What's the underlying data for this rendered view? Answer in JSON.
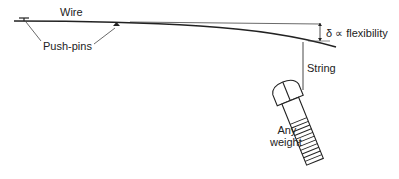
{
  "diagram": {
    "labels": {
      "wire": "Wire",
      "push_pins": "Push-pins",
      "deflection": "δ ∝ flexibility",
      "string": "String",
      "weight_line1": "Any",
      "weight_line2": "weight"
    },
    "colors": {
      "stroke": "#222222",
      "background": "#ffffff"
    }
  }
}
